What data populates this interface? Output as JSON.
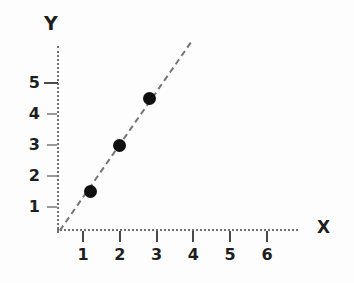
{
  "chart_data": {
    "type": "scatter",
    "title": "",
    "xlabel": "X",
    "ylabel": "Y",
    "points": [
      {
        "x": 1.2,
        "y": 1.5
      },
      {
        "x": 2.0,
        "y": 3.0
      },
      {
        "x": 2.8,
        "y": 4.5
      }
    ],
    "trend_line": {
      "style": "dashed",
      "x1": 0.35,
      "y1": 0.25,
      "x2": 3.9,
      "y2": 6.3
    },
    "x_ticks": [
      1,
      2,
      3,
      4,
      5,
      6
    ],
    "y_ticks": [
      {
        "v": 1
      },
      {
        "v": 2
      },
      {
        "v": 3
      },
      {
        "v": 4
      },
      {
        "v": 5,
        "strong": true
      }
    ],
    "xlim": [
      0,
      6.6
    ],
    "ylim": [
      0,
      6.2
    ],
    "grid": false,
    "legend": null
  },
  "colors": {
    "bg": "#fdfdfd",
    "axis": "#6f6f6f",
    "tick": "#4a4a4a",
    "label": "#1e1e1e",
    "line": "#757575",
    "point": "#0f0f0f"
  }
}
